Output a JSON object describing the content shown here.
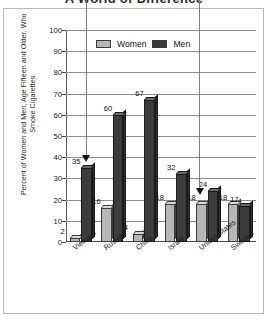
{
  "title": "A World of Difference",
  "frame": {
    "border_color": "#b9b9b9"
  },
  "legend": {
    "women_label": "Women",
    "men_label": "Men",
    "women_color": "#b6b6b6",
    "men_color": "#3c3c3c"
  },
  "annotations": [
    {
      "name": "vietnam-arrow",
      "target": "Vietnam",
      "x_pct": 10.5
    },
    {
      "name": "united-states-arrow",
      "target": "United States",
      "x_pct": 70.0
    }
  ],
  "chart_data": {
    "type": "bar",
    "title": "A World of Difference",
    "ylabel": "Percent of Women and Men, Age Fifteen and Older, Who Smoke Cigarettes",
    "xlabel": "",
    "ylim": [
      0,
      100
    ],
    "yticks": [
      0,
      10,
      20,
      30,
      40,
      50,
      60,
      70,
      80,
      90,
      100
    ],
    "ytick_labels": [
      "0",
      "10",
      "20",
      "30",
      "40",
      "50",
      "60",
      "70",
      "80",
      "90",
      "100"
    ],
    "grid": true,
    "legend_position": "top-center",
    "categories": [
      "Vietnam",
      "Russia",
      "China",
      "Israel",
      "United States",
      "Sweden"
    ],
    "series": [
      {
        "name": "Women",
        "color": "#b6b6b6",
        "values": [
          2,
          16,
          4,
          18,
          18,
          18
        ]
      },
      {
        "name": "Men",
        "color": "#3c3c3c",
        "values": [
          35,
          60,
          67,
          32,
          24,
          17
        ]
      }
    ]
  }
}
